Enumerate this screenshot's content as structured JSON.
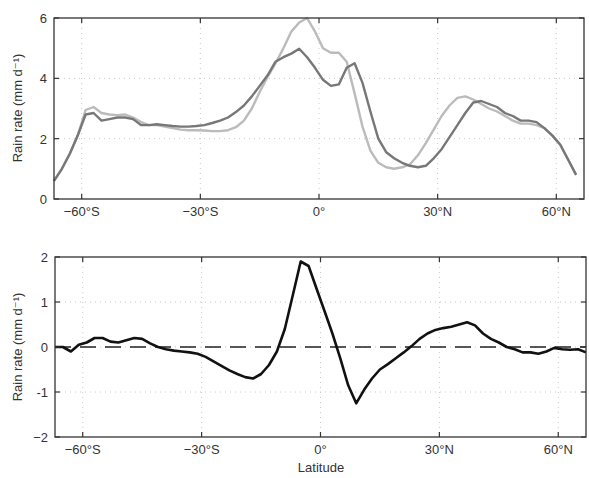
{
  "chart_data": [
    {
      "type": "line",
      "panel": "top",
      "title": "",
      "xlabel": "",
      "ylabel": "Rain rate  (mm d⁻¹)",
      "xlim": [
        -67,
        67
      ],
      "ylim": [
        0,
        6
      ],
      "xticks": [
        -60,
        -30,
        0,
        30,
        60
      ],
      "xtick_labels": [
        "−60°S",
        "−30°S",
        "0°",
        "30°N",
        "60°N"
      ],
      "yticks": [
        0,
        2,
        4,
        6
      ],
      "ytick_labels": [
        "0",
        "2",
        "4",
        "6"
      ],
      "grid": "dotted",
      "legend": null,
      "series": [
        {
          "name": "dark-gray-series",
          "color": "#777777",
          "x": [
            -67,
            -65,
            -63,
            -61,
            -59,
            -57,
            -55,
            -53,
            -51,
            -49,
            -47,
            -45,
            -43,
            -41,
            -39,
            -37,
            -35,
            -33,
            -31,
            -29,
            -27,
            -25,
            -23,
            -21,
            -19,
            -17,
            -15,
            -13,
            -11,
            -9,
            -7,
            -5,
            -3,
            -1,
            1,
            3,
            5,
            7,
            9,
            11,
            13,
            15,
            17,
            19,
            21,
            23,
            25,
            27,
            29,
            31,
            33,
            35,
            37,
            39,
            41,
            43,
            45,
            47,
            49,
            51,
            53,
            55,
            57,
            59,
            61,
            63,
            65,
            67
          ],
          "values": [
            0.6,
            1.0,
            1.5,
            2.1,
            2.8,
            2.85,
            2.6,
            2.65,
            2.7,
            2.7,
            2.65,
            2.45,
            2.45,
            2.48,
            2.45,
            2.42,
            2.4,
            2.4,
            2.42,
            2.45,
            2.52,
            2.6,
            2.7,
            2.88,
            3.1,
            3.4,
            3.75,
            4.1,
            4.55,
            4.7,
            4.82,
            4.98,
            4.7,
            4.35,
            3.95,
            3.75,
            3.8,
            4.35,
            4.5,
            3.85,
            2.9,
            2.0,
            1.55,
            1.35,
            1.2,
            1.1,
            1.05,
            1.1,
            1.35,
            1.65,
            2.05,
            2.45,
            2.85,
            3.2,
            3.25,
            3.15,
            3.05,
            2.85,
            2.75,
            2.6,
            2.6,
            2.55,
            2.35,
            2.1,
            1.8,
            1.3,
            0.8
          ]
        },
        {
          "name": "light-gray-series",
          "color": "#bbbbbb",
          "x": [
            -67,
            -65,
            -63,
            -61,
            -59,
            -57,
            -55,
            -53,
            -51,
            -49,
            -47,
            -45,
            -43,
            -41,
            -39,
            -37,
            -35,
            -33,
            -31,
            -29,
            -27,
            -25,
            -23,
            -21,
            -19,
            -17,
            -15,
            -13,
            -11,
            -9,
            -7,
            -5,
            -3,
            -1,
            1,
            3,
            5,
            7,
            9,
            11,
            13,
            15,
            17,
            19,
            21,
            23,
            25,
            27,
            29,
            31,
            33,
            35,
            37,
            39,
            41,
            43,
            45,
            47,
            49,
            51,
            53,
            55,
            57,
            59,
            61,
            63,
            65,
            67
          ],
          "values": [
            0.6,
            1.0,
            1.5,
            2.1,
            2.95,
            3.05,
            2.85,
            2.8,
            2.78,
            2.8,
            2.7,
            2.55,
            2.45,
            2.45,
            2.4,
            2.35,
            2.3,
            2.28,
            2.28,
            2.27,
            2.25,
            2.25,
            2.28,
            2.38,
            2.6,
            3.0,
            3.55,
            4.05,
            4.5,
            5.0,
            5.55,
            5.85,
            6.0,
            5.55,
            5.0,
            4.85,
            4.85,
            4.55,
            3.5,
            2.4,
            1.6,
            1.2,
            1.05,
            1.0,
            1.05,
            1.15,
            1.45,
            1.85,
            2.3,
            2.75,
            3.1,
            3.35,
            3.4,
            3.3,
            3.15,
            3.0,
            2.9,
            2.75,
            2.6,
            2.5,
            2.5,
            2.45,
            2.35,
            2.1,
            1.8,
            1.3,
            0.8
          ]
        }
      ]
    },
    {
      "type": "line",
      "panel": "bottom",
      "title": "",
      "xlabel": "Latitude",
      "ylabel": "Rain rate  (mm d⁻¹)",
      "xlim": [
        -67,
        67
      ],
      "ylim": [
        -2,
        2
      ],
      "xticks": [
        -60,
        -30,
        0,
        30,
        60
      ],
      "xtick_labels": [
        "−60°S",
        "−30°S",
        "0°",
        "30°N",
        "60°N"
      ],
      "yticks": [
        -2,
        -1,
        0,
        1,
        2
      ],
      "ytick_labels": [
        "−2",
        "-1",
        "0",
        "1",
        "2"
      ],
      "grid": "dotted",
      "reference_line": {
        "y": 0,
        "style": "dashed"
      },
      "legend": null,
      "series": [
        {
          "name": "difference",
          "color": "#111111",
          "x": [
            -67,
            -65,
            -63,
            -61,
            -59,
            -57,
            -55,
            -53,
            -51,
            -49,
            -47,
            -45,
            -43,
            -41,
            -39,
            -37,
            -35,
            -33,
            -31,
            -29,
            -27,
            -25,
            -23,
            -21,
            -19,
            -17,
            -15,
            -13,
            -11,
            -9,
            -7,
            -5,
            -3,
            -1,
            1,
            3,
            5,
            7,
            9,
            11,
            13,
            15,
            17,
            19,
            21,
            23,
            25,
            27,
            29,
            31,
            33,
            35,
            37,
            39,
            41,
            43,
            45,
            47,
            49,
            51,
            53,
            55,
            57,
            59,
            61,
            63,
            65,
            67
          ],
          "values": [
            0.0,
            0.0,
            -0.1,
            0.05,
            0.1,
            0.2,
            0.2,
            0.12,
            0.1,
            0.15,
            0.2,
            0.18,
            0.08,
            0.0,
            -0.05,
            -0.08,
            -0.1,
            -0.12,
            -0.15,
            -0.22,
            -0.32,
            -0.42,
            -0.52,
            -0.6,
            -0.67,
            -0.7,
            -0.6,
            -0.4,
            -0.1,
            0.4,
            1.15,
            1.9,
            1.8,
            1.3,
            0.8,
            0.3,
            -0.25,
            -0.85,
            -1.25,
            -0.95,
            -0.7,
            -0.5,
            -0.38,
            -0.25,
            -0.12,
            0.02,
            0.18,
            0.3,
            0.38,
            0.42,
            0.45,
            0.5,
            0.55,
            0.48,
            0.3,
            0.18,
            0.1,
            0.0,
            -0.05,
            -0.12,
            -0.12,
            -0.15,
            -0.1,
            -0.02,
            -0.05,
            -0.06,
            -0.05,
            -0.12
          ]
        }
      ]
    }
  ],
  "labels": {
    "top_ylabel": "Rain rate  (mm d⁻¹)",
    "bottom_ylabel": "Rain rate  (mm d⁻¹)",
    "bottom_xlabel": "Latitude"
  }
}
